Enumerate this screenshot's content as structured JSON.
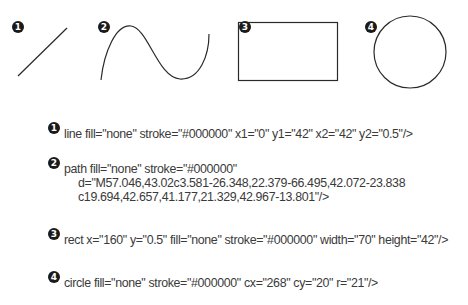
{
  "stroke_color": "#000000",
  "badge_color": "#1a1a1a",
  "text_color": "#3a3a3a",
  "shapes": [
    {
      "number": "1",
      "type": "line",
      "label": "line"
    },
    {
      "number": "2",
      "type": "path",
      "label": "curve path"
    },
    {
      "number": "3",
      "type": "rect",
      "label": "rectangle"
    },
    {
      "number": "4",
      "type": "circle",
      "label": "circle"
    }
  ],
  "code": [
    {
      "number": "1",
      "lines": [
        "line fill=\"none\" stroke=\"#000000\" x1=\"0\" y1=\"42\" x2=\"42\" y2=\"0.5\"/>"
      ]
    },
    {
      "number": "2",
      "lines": [
        "path fill=\"none\" stroke=\"#000000\"",
        "d=\"M57.046,43.02c3.581-26.348,22.379-66.495,42.072-23.838",
        "c19.694,42.657,41.177,21.329,42.967-13.801\"/>"
      ]
    },
    {
      "number": "3",
      "lines": [
        "rect x=\"160\" y=\"0.5\" fill=\"none\" stroke=\"#000000\" width=\"70\" height=\"42\"/>"
      ]
    },
    {
      "number": "4",
      "lines": [
        "circle fill=\"none\" stroke=\"#000000\" cx=\"268\" cy=\"20\" r=\"21\"/>"
      ]
    }
  ]
}
